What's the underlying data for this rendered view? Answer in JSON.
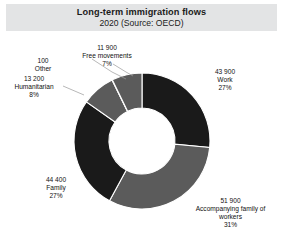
{
  "title": {
    "main": "Long-term immigration flows",
    "sub": "2020 (Source: OECD)"
  },
  "colors": {
    "band": "#e3e4e5",
    "dark": "#1a1a1a",
    "mid": "#5b5b5b",
    "background": "#ffffff",
    "text": "#111111",
    "leader": "#9a9a9a"
  },
  "labels": {
    "work": {
      "value": "43 900",
      "name": "Work",
      "percent": "27%"
    },
    "accompanying": {
      "value": "51 900",
      "name": "Accompanying family of",
      "name2": "workers",
      "percent": "31%"
    },
    "family": {
      "value": "44 400",
      "name": "Family",
      "percent": "27%"
    },
    "humanitarian": {
      "value": "13 200",
      "name": "Humanitarian",
      "percent": "8%"
    },
    "other": {
      "value": "100",
      "name": "Other",
      "percent": ""
    },
    "free_movements": {
      "value": "11 900",
      "name": "Free movements",
      "percent": "7%"
    }
  },
  "chart_data": {
    "type": "pie",
    "title": "Long-term immigration flows",
    "subtitle": "2020 (Source: OECD)",
    "donut": true,
    "inner_radius_ratio": 0.485,
    "start_angle_deg": 0,
    "direction": "clockwise",
    "unit": "persons",
    "labels": [
      "Work",
      "Accompanying family of workers",
      "Family",
      "Humanitarian",
      "Other",
      "Free movements"
    ],
    "values": [
      43900,
      51900,
      44400,
      13200,
      100,
      11900
    ],
    "percentages": [
      27,
      31,
      27,
      8,
      0,
      7
    ],
    "slice_colors": [
      "#1a1a1a",
      "#5b5b5b",
      "#1a1a1a",
      "#5b5b5b",
      "#1a1a1a",
      "#5b5b5b"
    ],
    "total": 165400,
    "legend": "none",
    "grid": false,
    "data_labels": "value + category + percent, placed outside with leader lines"
  }
}
